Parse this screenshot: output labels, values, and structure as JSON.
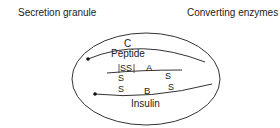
{
  "labels": {
    "secretion_granule": "Secretion granule",
    "converting_enzymes": "Converting enzymes"
  },
  "molecule": {
    "c_chain": "C",
    "peptide": "Peptide",
    "a_chain": "A",
    "b_chain": "B",
    "insulin": "Insulin",
    "intra_disulfide": "SS",
    "sulfur": "S"
  },
  "colors": {
    "line": "#333333",
    "text": "#222222",
    "background": "#ffffff"
  }
}
